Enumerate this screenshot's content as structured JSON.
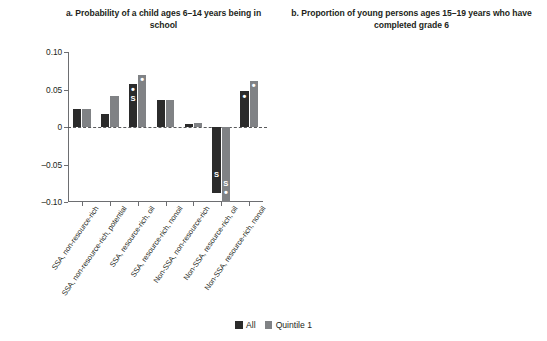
{
  "legend": {
    "items": [
      {
        "label": "All",
        "color": "#2b2b2b",
        "key": "all"
      },
      {
        "label": "Quintile 1",
        "color": "#808285",
        "key": "q1"
      }
    ]
  },
  "categories": [
    "SSA, non-resource-rich",
    "SSA, non-resource-rich, potential",
    "SSA, resource-rich, oil",
    "SSA, resource-rich, nonoil",
    "Non-SSA, non-resource-rich",
    "Non-SSA, resource-rich, oil",
    "Non-SSA, resource-rich, nonoil"
  ],
  "chart_data": [
    {
      "type": "bar",
      "panel": "a",
      "title": "a. Probability of a child ages 6–14 years being in school",
      "xlabel": "",
      "ylabel": "",
      "ylim": [
        -0.1,
        0.1
      ],
      "yticks": [
        0.1,
        0.05,
        0,
        -0.05,
        -0.1
      ],
      "ytick_labels": [
        "0.10",
        "0.05",
        "0",
        "–0.05",
        "–0.10"
      ],
      "grid": false,
      "legend_position": "bottom-center",
      "categories": [
        "SSA, non-resource-rich",
        "SSA, non-resource-rich, potential",
        "SSA, resource-rich, oil",
        "SSA, resource-rich, nonoil",
        "Non-SSA, non-resource-rich",
        "Non-SSA, resource-rich, oil",
        "Non-SSA, resource-rich, nonoil"
      ],
      "series": [
        {
          "name": "All",
          "color": "#2b2b2b",
          "values": [
            0.024,
            0.017,
            0.057,
            0.036,
            0.004,
            -0.088,
            0.048
          ],
          "markers": [
            "",
            "",
            "•\nS",
            "",
            "",
            "S",
            "•"
          ]
        },
        {
          "name": "Quintile 1",
          "color": "#808285",
          "values": [
            0.024,
            0.041,
            0.07,
            0.036,
            0.005,
            -0.1,
            0.062
          ],
          "markers": [
            "",
            "",
            "•",
            "",
            "",
            "S\n•",
            "•"
          ]
        }
      ]
    },
    {
      "type": "bar",
      "panel": "b",
      "title": "b. Proportion of young persons ages 15–19 years who have completed grade 6",
      "xlabel": "",
      "ylabel": "",
      "ylim": [
        -0.05,
        0.19
      ],
      "yticks": [
        0.15,
        0.05,
        -0.05
      ],
      "ytick_labels": [
        "0.15",
        "0.05",
        "–0.05"
      ],
      "grid": false,
      "legend_position": "bottom-center",
      "categories": [
        "SSA, non-resource-rich",
        "SSA, non-resource-rich, potential",
        "SSA, resource-rich, oil",
        "SSA, resource-rich, nonoil",
        "Non-SSA, non-resource-rich",
        "Non-SSA, resource-rich, oil",
        "Non-SSA, resource-rich, nonoil"
      ],
      "series": [
        {
          "name": "All",
          "color": "#2b2b2b",
          "values": [
            0.003,
            0.172,
            0.085,
            0.045,
            0.026,
            0.002,
            0.144
          ],
          "markers": [
            "",
            "•\nS",
            "",
            "",
            "",
            "",
            "•\nS"
          ]
        },
        {
          "name": "Quintile 1",
          "color": "#808285",
          "values": [
            0.004,
            0.11,
            0.004,
            0.007,
            0.052,
            0.01,
            0.166
          ],
          "markers": [
            "",
            "•",
            "",
            "",
            "",
            "",
            "•\nS"
          ]
        }
      ]
    }
  ]
}
